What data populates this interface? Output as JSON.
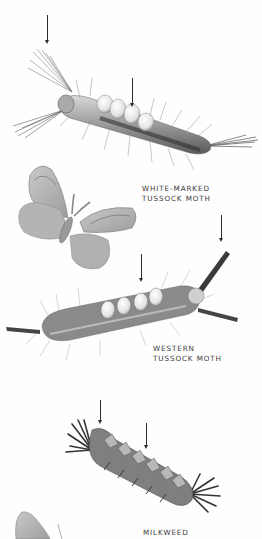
{
  "page": {
    "background": "#fefefe",
    "ink_color": "#3a3a3a"
  },
  "species": [
    {
      "id": "white-marked-tussock-moth",
      "label_lines": [
        "WHITE-MARKED",
        "TUSSOCK MOTH"
      ],
      "illustrations": [
        "caterpillar",
        "adult-moth"
      ],
      "arrows": 2
    },
    {
      "id": "western-tussock-moth",
      "label_lines": [
        "WESTERN",
        "TUSSOCK MOTH"
      ],
      "illustrations": [
        "caterpillar"
      ],
      "arrows": 2
    },
    {
      "id": "milkweed",
      "label_lines": [
        "MILKWEED"
      ],
      "illustrations": [
        "caterpillar",
        "adult-moth-partial"
      ],
      "arrows": 2
    }
  ]
}
